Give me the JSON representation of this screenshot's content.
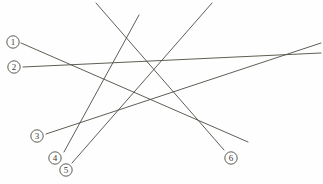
{
  "canvas": {
    "width": 323,
    "height": 184,
    "background": "#fefefe"
  },
  "style": {
    "line_color": "#4c4c42",
    "line_width": 0.9,
    "label_stroke": "#4a4a42",
    "label_text_color": "#3b3b35",
    "label_radius": 6.2,
    "label_font_size": 9
  },
  "puzzle": {
    "type": "line-tracing-maze",
    "label_count": 6,
    "line_count": 6
  },
  "labels": [
    {
      "id": "1",
      "text": "①",
      "cx": 13,
      "cy": 42
    },
    {
      "id": "2",
      "text": "②",
      "cx": 14,
      "cy": 67
    },
    {
      "id": "3",
      "text": "③",
      "cx": 37,
      "cy": 136
    },
    {
      "id": "4",
      "text": "④",
      "cx": 55,
      "cy": 158
    },
    {
      "id": "5",
      "text": "⑤",
      "cx": 66,
      "cy": 170
    },
    {
      "id": "6",
      "text": "⑥",
      "cx": 231,
      "cy": 158
    }
  ],
  "lines": [
    {
      "id": "line-1",
      "from_label": "1",
      "x1": 21,
      "y1": 43,
      "x2": 248,
      "y2": 142
    },
    {
      "id": "line-2",
      "from_label": "2",
      "x1": 23,
      "y1": 67,
      "x2": 321,
      "y2": 53
    },
    {
      "id": "line-3",
      "from_label": "3",
      "x1": 46,
      "y1": 134,
      "x2": 321,
      "y2": 43
    },
    {
      "id": "line-4",
      "from_label": "4",
      "x1": 64,
      "y1": 152,
      "x2": 139,
      "y2": 15
    },
    {
      "id": "line-5",
      "from_label": "5",
      "x1": 72,
      "y1": 163,
      "x2": 212,
      "y2": 3
    },
    {
      "id": "line-6",
      "from_label": "6",
      "x1": 224,
      "y1": 150,
      "x2": 96,
      "y2": 3
    }
  ]
}
